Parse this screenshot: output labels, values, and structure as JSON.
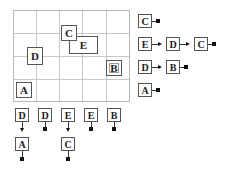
{
  "grid": {
    "columns": 5,
    "rows": 4
  },
  "regions": [
    {
      "label": "C",
      "shape": "square"
    },
    {
      "label": "E",
      "shape": "rect"
    },
    {
      "label": "D",
      "shape": "square"
    },
    {
      "label": "B",
      "shape": "square"
    },
    {
      "label": "A",
      "shape": "square"
    }
  ],
  "row_lists": [
    {
      "row": 1,
      "nodes": [
        "C"
      ]
    },
    {
      "row": 2,
      "nodes": [
        "E",
        "D",
        "C"
      ]
    },
    {
      "row": 3,
      "nodes": [
        "D",
        "B"
      ]
    },
    {
      "row": 4,
      "nodes": [
        "A"
      ]
    }
  ],
  "column_lists": [
    {
      "column": 1,
      "nodes": [
        "D",
        "A"
      ]
    },
    {
      "column": 2,
      "nodes": [
        "D"
      ]
    },
    {
      "column": 3,
      "nodes": [
        "E",
        "C"
      ]
    },
    {
      "column": 4,
      "nodes": [
        "E"
      ]
    },
    {
      "column": 5,
      "nodes": [
        "B"
      ]
    }
  ]
}
